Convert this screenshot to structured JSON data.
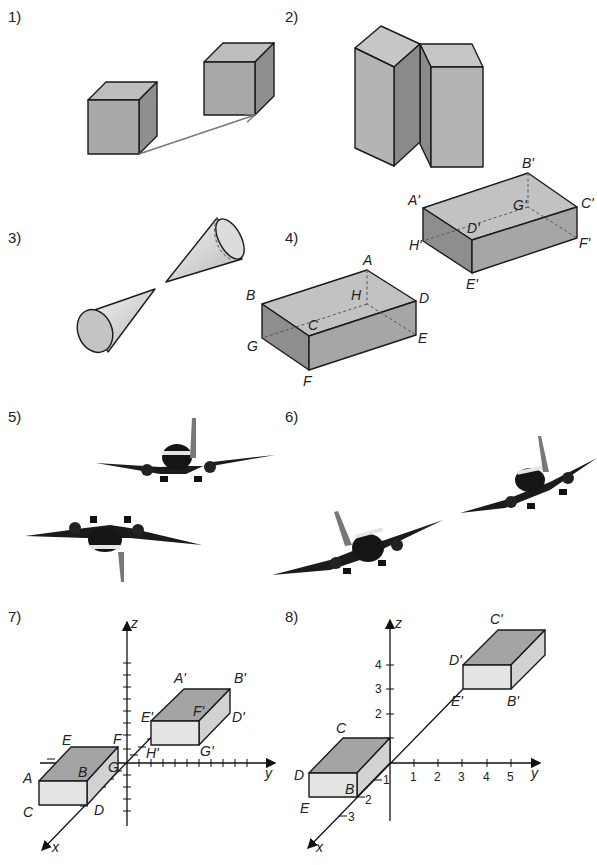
{
  "exercises": [
    {
      "number": "1)",
      "description": "Two cubes, one translated along an arrow"
    },
    {
      "number": "2)",
      "description": "Two tall rectangular prisms side by side"
    },
    {
      "number": "3)",
      "description": "Two cones pointing at each other (point reflection)"
    },
    {
      "number": "4)",
      "description": "Cuboid ABCDEFGH and its image A'B'C'D'E'F'G'H'",
      "labels": [
        "A",
        "B",
        "C",
        "D",
        "E",
        "F",
        "G",
        "H"
      ],
      "image_labels": [
        "A'",
        "B'",
        "C'",
        "D'",
        "E'",
        "F'",
        "G'",
        "H'"
      ]
    },
    {
      "number": "5)",
      "description": "Two airplanes, one upside down"
    },
    {
      "number": "6)",
      "description": "Two airplanes banking"
    },
    {
      "number": "7)",
      "description": "Cuboid in 3D coordinate system and its image",
      "axis_labels": {
        "x": "x",
        "y": "y",
        "z": "z"
      },
      "labels": [
        "A",
        "B",
        "C",
        "D",
        "E",
        "F",
        "G"
      ],
      "image_labels": [
        "A'",
        "B'",
        "D'",
        "E'",
        "F'",
        "G'",
        "H'"
      ]
    },
    {
      "number": "8)",
      "description": "Cuboid in 3D coordinate system with numbered axes and its image",
      "axis_labels": {
        "x": "x",
        "y": "y",
        "z": "z"
      },
      "y_ticks": [
        "1",
        "2",
        "3",
        "4",
        "5"
      ],
      "z_ticks": [
        "1",
        "2",
        "3",
        "4"
      ],
      "x_ticks": [
        "1",
        "2",
        "3"
      ],
      "labels": [
        "B",
        "C",
        "D",
        "E"
      ],
      "image_labels": [
        "B'",
        "C'",
        "D'",
        "E'"
      ]
    }
  ]
}
